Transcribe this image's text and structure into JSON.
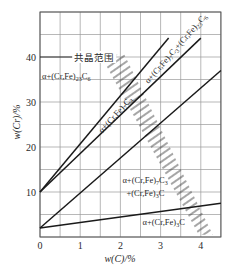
{
  "chart_data": {
    "type": "line",
    "title": "",
    "xlabel": "w(C)/%",
    "ylabel": "w(Cr)/%",
    "xlim": [
      0,
      4.5
    ],
    "ylim": [
      0,
      50
    ],
    "x_ticks": [
      0,
      1,
      2,
      3,
      4
    ],
    "y_ticks": [
      10,
      20,
      30,
      40
    ],
    "x_grid_step": 0.5,
    "y_grid_step": 5,
    "grid": true,
    "legend": null,
    "series": [
      {
        "name": "boundary-1",
        "x": [
          0,
          3.2
        ],
        "y": [
          10,
          44.2
        ]
      },
      {
        "name": "boundary-2",
        "x": [
          0,
          4.0
        ],
        "y": [
          10,
          44.2
        ]
      },
      {
        "name": "boundary-3",
        "x": [
          0,
          4.5
        ],
        "y": [
          2,
          37
        ]
      },
      {
        "name": "boundary-4",
        "x": [
          0,
          4.5
        ],
        "y": [
          2,
          7.5
        ]
      }
    ],
    "shaded_band": {
      "name": "共晶范围",
      "polygon": [
        [
          1.5,
          40.5
        ],
        [
          2.1,
          40.5
        ],
        [
          4.3,
          0.5
        ],
        [
          3.95,
          0.5
        ]
      ],
      "style": "hatched"
    },
    "annotations": [
      {
        "text": "共晶范围",
        "x": 0.85,
        "y": 40,
        "leader_line": [
          [
            0,
            40
          ],
          [
            1.55,
            40
          ]
        ]
      },
      {
        "text": "α+(Cr,Fe)₂₃C₆",
        "x": 0.05,
        "y": 35.2,
        "rotation": 0
      },
      {
        "text": "α+(Cr,Fe)₇C₃+(Cr,Fe)₂₃C₆",
        "x": 2.7,
        "y": 34,
        "rotation": -49
      },
      {
        "text": "α+(Cr,Fe)₇C₃",
        "x": 1.55,
        "y": 23,
        "rotation": -48
      },
      {
        "text": "α+(Cr,Fe)₇C₃",
        "x": 2.05,
        "y": 12,
        "rotation": 0
      },
      {
        "text": "+(Cr,Fe)₃C",
        "x": 2.15,
        "y": 9.2,
        "rotation": 0
      },
      {
        "text": "α+(Cr,Fe)₃C",
        "x": 2.55,
        "y": 2.6,
        "rotation": 0
      }
    ]
  },
  "axes": {
    "x_label": "w(C)/%",
    "y_label": "w(Cr)/%",
    "x_tick_labels": [
      "0",
      "1",
      "2",
      "3",
      "4"
    ],
    "y_tick_labels": [
      "10",
      "20",
      "30",
      "40"
    ]
  },
  "colors": {
    "grid": "#9a9a9a",
    "frame": "#555555",
    "line": "#1a1a1a",
    "hatch": "#3a3a3a",
    "text": "#2a2a2a"
  }
}
